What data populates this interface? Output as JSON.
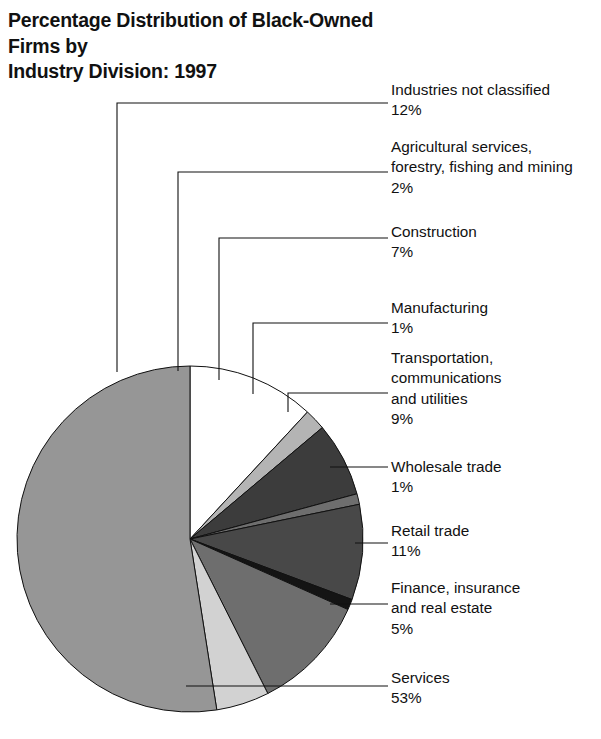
{
  "title": "Percentage Distribution of Black-Owned Firms by\nIndustry Division: 1997",
  "chart_data": {
    "type": "pie",
    "title": "Percentage Distribution of Black-Owned Firms by Industry Division: 1997",
    "unit": "percent",
    "total": 102,
    "start_angle_deg": 0,
    "direction": "clockwise",
    "legend_position": "right-callouts",
    "categories": [
      "Industries not classified",
      "Agricultural services, forestry, fishing and mining",
      "Construction",
      "Manufacturing",
      "Transportation, communications and utilities",
      "Wholesale trade",
      "Retail trade",
      "Finance, insurance and real estate",
      "Services"
    ],
    "values": [
      12,
      2,
      7,
      1,
      9,
      1,
      11,
      5,
      53
    ],
    "labels_pct": [
      "12%",
      "2%",
      "7%",
      "1%",
      "9%",
      "1%",
      "11%",
      "5%",
      "53%"
    ],
    "colors": [
      "#ffffff",
      "#b4b4b4",
      "#3c3c3c",
      "#6e6e6e",
      "#484848",
      "#141414",
      "#6e6e6e",
      "#d2d2d2",
      "#969696"
    ]
  },
  "slices": [
    {
      "name": "Industries not classified",
      "value": 12,
      "pct_label": "12%",
      "color": "#ffffff",
      "label_lines": "Industries not classified",
      "label_x": 391,
      "label_y": 80,
      "leader": {
        "label_x": 388,
        "y": 103,
        "corner_x": 117,
        "pie_y": 372
      }
    },
    {
      "name": "Agricultural services, forestry, fishing and mining",
      "value": 2,
      "pct_label": "2%",
      "color": "#b4b4b4",
      "label_lines": "Agricultural services,\nforestry, fishing and mining",
      "label_x": 391,
      "label_y": 137,
      "leader": {
        "label_x": 388,
        "y": 172,
        "corner_x": 178,
        "pie_y": 371
      }
    },
    {
      "name": "Construction",
      "value": 7,
      "pct_label": "7%",
      "color": "#3c3c3c",
      "label_lines": "Construction",
      "label_x": 391,
      "label_y": 222,
      "leader": {
        "label_x": 388,
        "y": 238,
        "corner_x": 219,
        "pie_y": 380
      }
    },
    {
      "name": "Manufacturing",
      "value": 1,
      "pct_label": "1%",
      "color": "#6e6e6e",
      "label_lines": "Manufacturing",
      "label_x": 391,
      "label_y": 298,
      "leader": {
        "label_x": 388,
        "y": 323,
        "corner_x": 253,
        "pie_y": 394
      }
    },
    {
      "name": "Transportation, communications and utilities",
      "value": 9,
      "pct_label": "9%",
      "color": "#484848",
      "label_lines": "Transportation,\ncommunications\nand utilities",
      "label_x": 391,
      "label_y": 348,
      "leader": {
        "label_x": 388,
        "y": 393,
        "corner_x": 288,
        "pie_y": 412
      }
    },
    {
      "name": "Wholesale trade",
      "value": 1,
      "pct_label": "1%",
      "color": "#141414",
      "label_lines": "Wholesale trade",
      "label_x": 391,
      "label_y": 457,
      "leader": {
        "label_x": 388,
        "y": 467,
        "corner_x": 330,
        "pie_y": 467
      }
    },
    {
      "name": "Retail trade",
      "value": 11,
      "pct_label": "11%",
      "color": "#6e6e6e",
      "label_lines": "Retail trade",
      "label_x": 391,
      "label_y": 521,
      "leader": {
        "label_x": 388,
        "y": 543,
        "corner_x": 355,
        "pie_y": 543
      }
    },
    {
      "name": "Finance, insurance and real estate",
      "value": 5,
      "pct_label": "5%",
      "color": "#d2d2d2",
      "label_lines": "Finance, insurance\nand real estate",
      "label_x": 391,
      "label_y": 578,
      "leader": {
        "label_x": 388,
        "y": 604,
        "corner_x": 330,
        "pie_y": 604
      }
    },
    {
      "name": "Services",
      "value": 53,
      "pct_label": "53%",
      "color": "#969696",
      "label_lines": "Services",
      "label_x": 391,
      "label_y": 668,
      "leader": {
        "label_x": 388,
        "y": 686,
        "corner_x": 186,
        "pie_y": 686
      }
    }
  ],
  "geometry": {
    "cx": 190,
    "cy": 539,
    "r": 173
  }
}
